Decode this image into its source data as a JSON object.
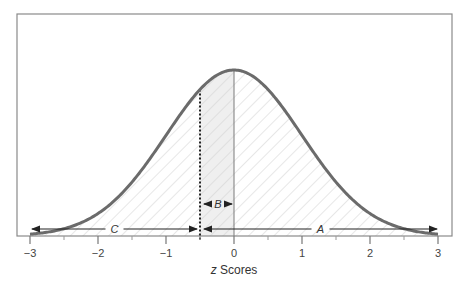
{
  "chart_data": {
    "type": "area",
    "title": "",
    "xlabel": "z Scores",
    "xlabel_italic_part": "z",
    "xlabel_rest": " Scores",
    "ylabel": "",
    "xlim": [
      -3,
      3
    ],
    "x_ticks": [
      -3,
      -2,
      -1,
      0,
      1,
      2,
      3
    ],
    "x_tick_labels": [
      "−3",
      "−2",
      "−1",
      "0",
      "1",
      "2",
      "3"
    ],
    "grid": false,
    "legend": null,
    "curve": "standard normal distribution",
    "markers": {
      "dotted_line_z": -0.5,
      "solid_line_z": 0
    },
    "regions": [
      {
        "label": "A",
        "from": -0.5,
        "to": 3,
        "description": "area above z = -0.5 (hatched)"
      },
      {
        "label": "B",
        "from": -0.5,
        "to": 0,
        "description": "area between z = -0.5 and mean (shaded)"
      },
      {
        "label": "C",
        "from": -3,
        "to": -0.5,
        "description": "area below z = -0.5 (hatched)"
      }
    ]
  },
  "labels": {
    "A": "A",
    "B": "B",
    "C": "C"
  },
  "colors": {
    "curve": "#6b6b6b",
    "frame": "#8a8a8a",
    "hatch": "#d0d0d0",
    "shade_B": "#efefef",
    "arrows": "#222222"
  }
}
